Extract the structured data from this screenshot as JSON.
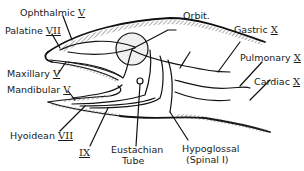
{
  "figure": {
    "labels": {
      "ophthalmic": {
        "name": "Ophthalmic",
        "numeral": "V"
      },
      "palatine": {
        "name": "Palatine",
        "numeral": "VII"
      },
      "maxillary": {
        "name": "Maxillary",
        "numeral": "V"
      },
      "mandibular": {
        "name": "Mandibular",
        "numeral": "V"
      },
      "hyoidean": {
        "name": "Hyoidean",
        "numeral": "VII"
      },
      "glossopharyngeal": {
        "name": "",
        "numeral": "IX"
      },
      "eustachian_line1": "Eustachian",
      "eustachian_line2": "Tube",
      "hypoglossal_line1": "Hypoglossal",
      "hypoglossal_line2": "(Spinal I)",
      "orbit": "Orbit.",
      "gastric": {
        "name": "Gastric",
        "numeral": "X"
      },
      "pulmonary": {
        "name": "Pulmonary",
        "numeral": "X"
      },
      "cardiac": {
        "name": "Cardiac",
        "numeral": "X"
      }
    }
  }
}
